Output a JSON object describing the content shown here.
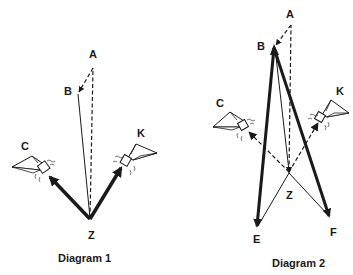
{
  "diagram1": {
    "caption": "Diagram 1",
    "labels": {
      "A": "A",
      "B": "B",
      "C": "C",
      "K": "K",
      "Z": "Z"
    }
  },
  "diagram2": {
    "caption": "Diagram 2",
    "labels": {
      "A": "A",
      "B": "B",
      "C": "C",
      "K": "K",
      "Z": "Z",
      "E": "E",
      "F": "F"
    }
  },
  "icons": {
    "glider": "hang-glider-icon"
  },
  "colors": {
    "ink": "#1a1a1a",
    "background": "#ffffff"
  }
}
